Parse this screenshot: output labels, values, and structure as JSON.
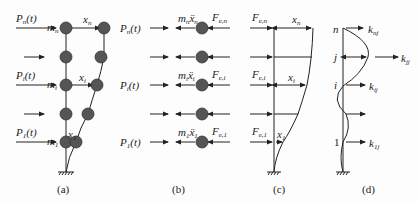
{
  "figure": {
    "panels": [
      {
        "id": "a",
        "caption": "(a)",
        "description": "Lumped-mass cantilever model with applied loads and floor displacements",
        "forces": [
          "P_n(t)",
          "",
          "P_i(t)",
          "",
          "P_1(t)"
        ],
        "masses": [
          "m_n",
          "m_i",
          "m_1"
        ],
        "displacements": [
          "x_n",
          "x_i",
          "x_1"
        ]
      },
      {
        "id": "b",
        "caption": "(b)",
        "description": "Free body of masses with inertia forces and equivalent forces",
        "forces": [
          "P_n(t)",
          "",
          "P_i(t)",
          "",
          "P_1(t)"
        ],
        "inertia": [
          "m_n ẍ_n",
          "m_i ẍ_i",
          "m_1 ẍ_1"
        ],
        "equivalent_forces": [
          "F_e,n",
          "F_e,i",
          "F_e,1"
        ]
      },
      {
        "id": "c",
        "caption": "(c)",
        "description": "Equivalent static forces and displacements",
        "equivalent_forces": [
          "F_e,n",
          "F_e,i",
          "F_e,1"
        ],
        "displacements": [
          "x_n",
          "x_i",
          "x_1"
        ]
      },
      {
        "id": "d",
        "caption": "(d)",
        "description": "Stiffness coefficients from unit displacement at level j",
        "levels": [
          "n",
          "j",
          "i",
          "1"
        ],
        "stiffness": [
          "k_nj",
          "k_jj",
          "k_ij",
          "k_1j"
        ]
      }
    ]
  },
  "labels": {
    "a_Pn": "P",
    "a_Pn_sub": "n",
    "a_t": "(t)",
    "a_Pi": "P",
    "a_Pi_sub": "i",
    "a_P1": "P",
    "a_P1_sub": "1",
    "a_mn": "m",
    "a_mn_sub": "n",
    "a_mi": "m",
    "a_mi_sub": "i",
    "a_m1": "m",
    "a_m1_sub": "1",
    "a_xn": "x",
    "a_xn_sub": "n",
    "a_xi": "x",
    "a_xi_sub": "i",
    "a_x1": "x",
    "a_x1_sub": "1",
    "b_mxn": "m",
    "b_mxn_sub": "n",
    "b_xdd_n": "ẍ",
    "b_xdd_n_sub": "n",
    "b_mxi": "m",
    "b_mxi_sub": "i",
    "b_xdd_i": "ẍ",
    "b_xdd_i_sub": "i",
    "b_mx1": "m",
    "b_mx1_sub": "1",
    "b_xdd_1": "ẍ",
    "b_xdd_1_sub": "1",
    "F": "F",
    "Fen_sub": "e,n",
    "Fei_sub": "e,i",
    "Fe1_sub": "e,1",
    "d_n": "n",
    "d_j": "j",
    "d_i": "i",
    "d_1": "1",
    "k": "k",
    "knj_sub": "nj",
    "kjj_sub": "jj",
    "kij_sub": "ij",
    "k1j_sub": "1j",
    "cap_a": "(a)",
    "cap_b": "(b)",
    "cap_c": "(c)",
    "cap_d": "(d)"
  }
}
